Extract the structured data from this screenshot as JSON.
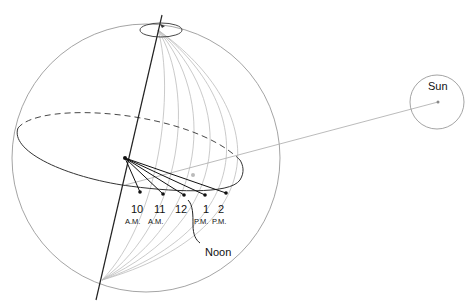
{
  "diagram": {
    "sun_label": "Sun",
    "noon_label": "Noon",
    "hours": [
      {
        "num": "10",
        "period": "A.M."
      },
      {
        "num": "11",
        "period": "A.M."
      },
      {
        "num": "12",
        "period": ""
      },
      {
        "num": "1",
        "period": "P.M."
      },
      {
        "num": "2",
        "period": "P.M."
      }
    ],
    "colors": {
      "axis": "#222222",
      "sphere": "#9a9a9a",
      "meridian": "#b8b8b8",
      "equator": "#333333",
      "hour_lines": "#111111"
    }
  }
}
